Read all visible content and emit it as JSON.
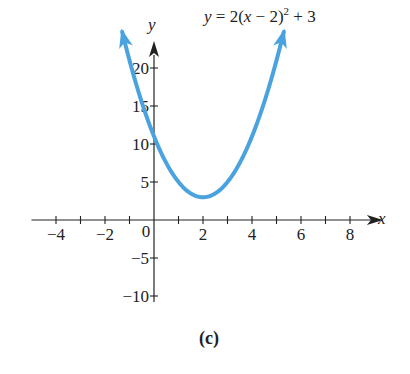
{
  "chart_data": {
    "type": "line",
    "title": "",
    "caption": "(c)",
    "xlabel": "x",
    "ylabel": "y",
    "xlim": [
      -5.0,
      9.1
    ],
    "ylim": [
      -10.8,
      22.5
    ],
    "grid": false,
    "x_ticks": [
      -4,
      -3,
      -2,
      -1,
      1,
      2,
      3,
      4,
      5,
      6,
      7,
      8
    ],
    "x_tick_labels": [
      {
        "value": -4,
        "label": "−4"
      },
      {
        "value": -2,
        "label": "−2"
      },
      {
        "value": 2,
        "label": "2"
      },
      {
        "value": 4,
        "label": "4"
      },
      {
        "value": 6,
        "label": "6"
      },
      {
        "value": 8,
        "label": "8"
      }
    ],
    "origin_label": "0",
    "y_ticks": [
      -10,
      -5,
      5,
      10,
      15,
      20
    ],
    "y_tick_labels": [
      {
        "value": -10,
        "label": "−10"
      },
      {
        "value": -5,
        "label": "−5"
      },
      {
        "value": 5,
        "label": "5"
      },
      {
        "value": 10,
        "label": "10"
      },
      {
        "value": 15,
        "label": "15"
      },
      {
        "value": 20,
        "label": "20"
      }
    ],
    "series": [
      {
        "name": "y = 2(x − 2)^2 + 3",
        "function": {
          "a": 2,
          "h": 2,
          "k": 3
        },
        "x_range": [
          -1.3,
          5.3
        ],
        "vertex": [
          2,
          3
        ],
        "y_intercept": 11,
        "color": "#4aa3df",
        "arrows_at_ends": true
      }
    ],
    "annotations": [
      {
        "text_parts": [
          "y",
          " = 2(",
          "x",
          " − 2)",
          "2",
          " + 3"
        ],
        "position": "top-right"
      }
    ],
    "axis_color": "#222222"
  }
}
